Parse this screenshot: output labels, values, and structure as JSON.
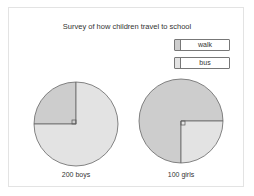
{
  "chart_data": {
    "type": "pie",
    "title": "Survey of how children travel to school",
    "legend": [
      {
        "name": "walk",
        "color": "#cdcdcd"
      },
      {
        "name": "bus",
        "color": "#e3e3e3"
      }
    ],
    "legend_position": "top-right",
    "pies": [
      {
        "label": "200 boys",
        "total": 200,
        "slices": [
          {
            "name": "walk",
            "fraction": 0.25
          },
          {
            "name": "bus",
            "fraction": 0.75
          }
        ]
      },
      {
        "label": "100 girls",
        "total": 100,
        "slices": [
          {
            "name": "walk",
            "fraction": 0.75
          },
          {
            "name": "bus",
            "fraction": 0.25
          }
        ]
      }
    ]
  }
}
